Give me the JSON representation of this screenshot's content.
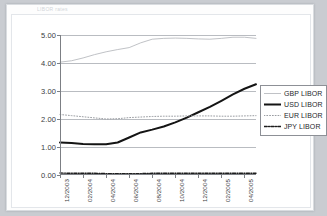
{
  "page": {
    "title_strip": "LIBOR rates"
  },
  "chart_data": {
    "type": "line",
    "title": "",
    "xlabel": "",
    "ylabel": "",
    "ylim": [
      0.0,
      5.0
    ],
    "yticks": [
      "0.00",
      "1.00",
      "2.00",
      "3.00",
      "4.00",
      "5.00"
    ],
    "ytick_values": [
      0.0,
      1.0,
      2.0,
      3.0,
      4.0,
      5.0
    ],
    "grid": true,
    "legend_position": "right",
    "categories": [
      "12/2003",
      "01/2004",
      "02/2004",
      "03/2004",
      "04/2004",
      "05/2004",
      "06/2004",
      "07/2004",
      "08/2004",
      "09/2004",
      "10/2004",
      "11/2004",
      "12/2004",
      "01/2005",
      "02/2005",
      "03/2005",
      "04/2005",
      "05/2005"
    ],
    "xtick_labels": [
      "12/2003",
      "02/2004",
      "04/2004",
      "06/2004",
      "08/2004",
      "10/2004",
      "12/2004",
      "02/2005",
      "04/2005"
    ],
    "xtick_indices": [
      0,
      2,
      4,
      6,
      8,
      10,
      12,
      14,
      16
    ],
    "series": [
      {
        "name": "GBP LIBOR",
        "style": "solid-thin",
        "color": "#b0b3b8",
        "width": 0.8,
        "values": [
          4.03,
          4.08,
          4.18,
          4.3,
          4.4,
          4.48,
          4.55,
          4.72,
          4.85,
          4.88,
          4.89,
          4.88,
          4.86,
          4.85,
          4.88,
          4.92,
          4.92,
          4.88
        ]
      },
      {
        "name": "USD LIBOR",
        "style": "solid-bold",
        "color": "#141414",
        "width": 2.0,
        "values": [
          1.16,
          1.14,
          1.11,
          1.1,
          1.1,
          1.16,
          1.34,
          1.52,
          1.62,
          1.73,
          1.88,
          2.05,
          2.24,
          2.43,
          2.65,
          2.88,
          3.08,
          3.24
        ]
      },
      {
        "name": "EUR LIBOR",
        "style": "dotted",
        "color": "#9a9da2",
        "width": 1.0,
        "values": [
          2.16,
          2.12,
          2.08,
          2.04,
          2.0,
          2.01,
          2.05,
          2.07,
          2.09,
          2.1,
          2.1,
          2.11,
          2.11,
          2.11,
          2.1,
          2.1,
          2.11,
          2.12
        ]
      },
      {
        "name": "JPY LIBOR",
        "style": "dash-dot",
        "color": "#1d1d1d",
        "width": 1.4,
        "values": [
          0.07,
          0.06,
          0.06,
          0.06,
          0.05,
          0.05,
          0.05,
          0.05,
          0.06,
          0.06,
          0.06,
          0.06,
          0.06,
          0.06,
          0.06,
          0.06,
          0.06,
          0.06
        ]
      }
    ],
    "legend": [
      {
        "label": "GBP LIBOR",
        "style": "solid-thin",
        "color": "#b0b3b8"
      },
      {
        "label": "USD LIBOR",
        "style": "solid-bold",
        "color": "#141414"
      },
      {
        "label": "EUR LIBOR",
        "style": "dotted",
        "color": "#9a9da2"
      },
      {
        "label": "JPY LIBOR",
        "style": "dash-dot",
        "color": "#1d1d1d"
      }
    ]
  },
  "colors": {
    "page_background": "#c9ccd1",
    "sheet": "#fdfdfd",
    "axis": "#7c7f84",
    "gridline": "#b9bcc1",
    "text": "#3a3c40"
  }
}
